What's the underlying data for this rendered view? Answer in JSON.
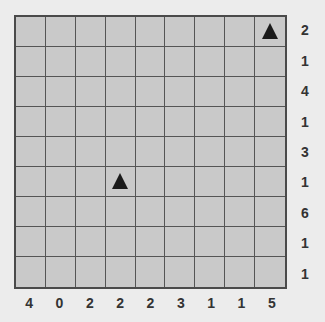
{
  "puzzle": {
    "rows": 9,
    "cols": 9,
    "row_clues": [
      "2",
      "1",
      "4",
      "1",
      "3",
      "1",
      "6",
      "1",
      "1"
    ],
    "col_clues": [
      "4",
      "0",
      "2",
      "2",
      "2",
      "3",
      "1",
      "1",
      "5"
    ],
    "markers": [
      {
        "row": 0,
        "col": 8,
        "type": "triangle"
      },
      {
        "row": 5,
        "col": 3,
        "type": "triangle"
      }
    ]
  },
  "colors": {
    "background": "#ececec",
    "cell": "#c9c9c9",
    "grid_line": "#555555",
    "marker": "#1a1a1a",
    "clue_text": "#333333"
  }
}
